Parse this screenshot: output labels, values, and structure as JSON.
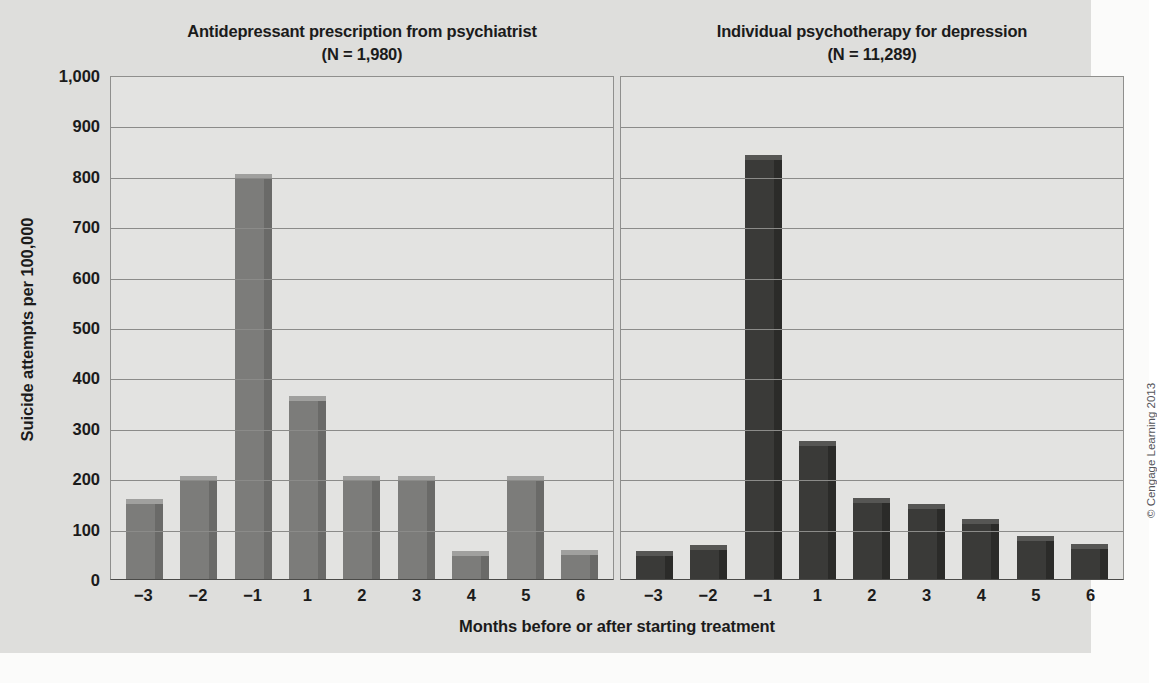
{
  "figure": {
    "y_axis_title": "Suicide attempts per 100,000",
    "x_axis_title": "Months before or after starting treatment",
    "credit": "© Cengage Learning 2013",
    "background_color": "#dededc",
    "plot_background_color": "#e3e3e1",
    "gridline_color": "#8b8b89",
    "left_bar_color": "#7c7c7a",
    "right_bar_color": "#3a3a38"
  },
  "y_ticks": [
    "1,000",
    "900",
    "800",
    "700",
    "600",
    "500",
    "400",
    "300",
    "200",
    "100",
    "0"
  ],
  "panels": [
    {
      "title": "Antidepressant prescription from psychiatrist",
      "subtitle": "(N = 1,980)"
    },
    {
      "title": "Individual psychotherapy for depression",
      "subtitle": "(N = 11,289)"
    }
  ],
  "chart_data": [
    {
      "type": "bar",
      "title": "Antidepressant prescription from psychiatrist",
      "subtitle": "(N = 1,980)",
      "xlabel": "Months before or after starting treatment",
      "ylabel": "Suicide attempts per 100,000",
      "ylim": [
        0,
        1000
      ],
      "ytick_step": 100,
      "grid": true,
      "legend": "none",
      "sample_size": 1980,
      "categories": [
        "−3",
        "−2",
        "−1",
        "1",
        "2",
        "3",
        "4",
        "5",
        "6"
      ],
      "values": [
        150,
        196,
        796,
        356,
        196,
        196,
        48,
        196,
        50
      ],
      "bar_color": "#7c7c7a"
    },
    {
      "type": "bar",
      "title": "Individual psychotherapy for depression",
      "subtitle": "(N = 11,289)",
      "xlabel": "Months before or after starting treatment",
      "ylabel": "Suicide attempts per 100,000",
      "ylim": [
        0,
        1000
      ],
      "ytick_step": 100,
      "grid": true,
      "legend": "none",
      "sample_size": 11289,
      "categories": [
        "−3",
        "−2",
        "−1",
        "1",
        "2",
        "3",
        "4",
        "5",
        "6"
      ],
      "values": [
        48,
        60,
        833,
        265,
        152,
        140,
        112,
        78,
        62
      ],
      "bar_color": "#3a3a38"
    }
  ]
}
